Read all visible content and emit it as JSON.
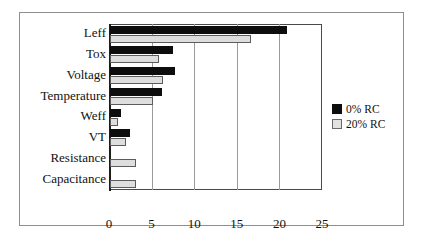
{
  "chart_data": {
    "type": "bar",
    "orientation": "horizontal",
    "title": "",
    "xlabel": "",
    "ylabel": "",
    "categories": [
      "Leff",
      "Tox",
      "Voltage",
      "Temperature",
      "Weff",
      "VT",
      "Resistance",
      "Capacitance"
    ],
    "series": [
      {
        "name": "0% RC",
        "color": "#0d0d0d",
        "values": [
          20.8,
          7.4,
          7.6,
          6.1,
          1.3,
          2.4,
          0,
          0
        ]
      },
      {
        "name": "20% RC",
        "color": "#dedede",
        "values": [
          16.5,
          5.8,
          6.2,
          5.0,
          0.9,
          1.9,
          3.1,
          3.1
        ]
      }
    ],
    "xticks": [
      "0",
      "5",
      "10",
      "15",
      "20",
      "25"
    ],
    "xtick_values": [
      0,
      5,
      10,
      15,
      20,
      25
    ],
    "xlim": [
      0,
      25
    ],
    "grid": "vertical",
    "legend_position": "right"
  },
  "legend": {
    "items": [
      {
        "label": "0% RC",
        "swatch": "dark-swatch"
      },
      {
        "label": "20% RC",
        "swatch": "light-swatch"
      }
    ]
  }
}
